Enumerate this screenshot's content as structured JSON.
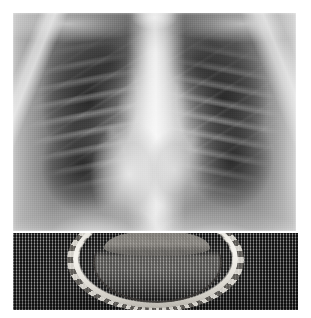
{
  "figure": {
    "background_color": "#ffffff",
    "width": 311,
    "height": 318,
    "layout": "two stacked image panels, white margins",
    "panel_count": 2
  },
  "panels": [
    {
      "id": "panel-a",
      "name": "chest-radiograph",
      "modality": "plain radiograph",
      "view": "posteroanterior (PA) chest",
      "subject": "human thorax",
      "bounds": {
        "x": 13,
        "y": 13,
        "width": 283,
        "height": 218
      },
      "colors": {
        "darkest": "#1a1a1a",
        "lung_field": "#4f4f4f",
        "soft_tissue": "#9a9a9a",
        "mediastinum": "#eeeeee",
        "brightest": "#fafafa"
      },
      "visible_structures": [
        "right lung field",
        "left lung field",
        "mediastinum",
        "cardiac silhouette",
        "thoracic spine",
        "posterior ribs",
        "anterior ribs",
        "clavicles",
        "right hemidiaphragm",
        "left hemidiaphragm",
        "costophrenic angles",
        "hilar vascular markings",
        "trachea"
      ]
    },
    {
      "id": "panel-b",
      "name": "specimen-photograph",
      "modality": "gross photograph",
      "subject": "crown bottle cap on woven mesh backing",
      "bounds": {
        "x": 13,
        "y": 233,
        "width": 285,
        "height": 77
      },
      "colors": {
        "background_mesh_dark": "#2e2e2e",
        "background_mesh_light": "#4a4a4a",
        "specimen_highlight": "#f6f4ef",
        "specimen_midtone": "#c9c7c2",
        "specimen_shadow": "#5e5b57"
      },
      "visible_structures": [
        "crimped crown cap skirt",
        "serrated rim teeth",
        "inner liner groove",
        "metallic specular highlight",
        "woven textile mesh background",
        "cast shadow"
      ]
    }
  ],
  "captions": {
    "panel_a_label": "",
    "panel_b_label": "",
    "figure_caption": ""
  }
}
